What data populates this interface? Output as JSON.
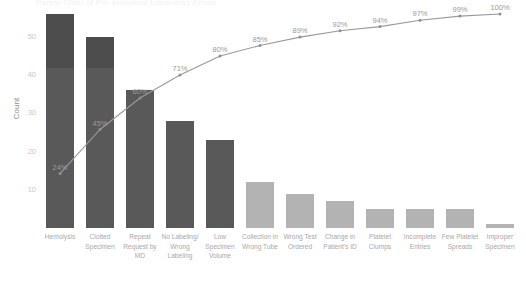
{
  "chart_data": {
    "type": "bar",
    "title": "Pareto Chart of Pre-Analytical Laboratory Errors",
    "xlabel": "",
    "ylabel": "Count",
    "ylim": [
      0,
      56
    ],
    "yticks": [
      10,
      20,
      30,
      40,
      50
    ],
    "grid": false,
    "legend": false,
    "categories": [
      "Hemolysis",
      "Clotted Specimen",
      "Repeat Request by MD",
      "No Labeling/ Wrong Labeling",
      "Low Specimen Volume",
      "Collection in Wrong Tube",
      "Wrong Test Ordered",
      "Change in Patient's ID",
      "Platelet Clumps",
      "Incomplete Entries",
      "Few Platelet Spreads",
      "Improper Specimen"
    ],
    "values": [
      56,
      50,
      36,
      28,
      23,
      12,
      9,
      7,
      5,
      5,
      5,
      1
    ],
    "cumulative_percent": [
      24,
      45,
      60,
      71,
      80,
      85,
      89,
      92,
      94,
      97,
      99,
      100
    ],
    "cumulative_percent_labels": [
      "24%",
      "45%",
      "60%",
      "71%",
      "80%",
      "85%",
      "89%",
      "92%",
      "94%",
      "97%",
      "99%",
      "100%"
    ],
    "series": [
      {
        "name": "Count",
        "type": "bar",
        "values": [
          56,
          50,
          36,
          28,
          23,
          12,
          9,
          7,
          5,
          5,
          5,
          1
        ]
      },
      {
        "name": "Cumulative %",
        "type": "line",
        "values": [
          24,
          45,
          60,
          71,
          80,
          85,
          89,
          92,
          94,
          97,
          99,
          100
        ]
      }
    ],
    "colors": {
      "bar_primary": "#595959",
      "bar_secondary": "#b3b3b3",
      "line": "#9a9a9a",
      "text": "#a8a8a8",
      "background": "#ffffff"
    },
    "primary_bar_count": 5
  }
}
